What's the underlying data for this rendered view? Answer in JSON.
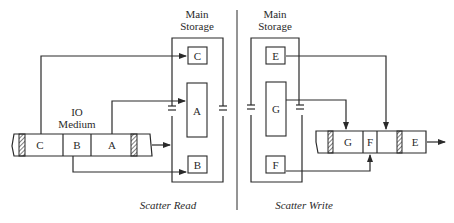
{
  "left_panel": {
    "storage_title_line1": "Main",
    "storage_title_line2": "Storage",
    "medium_title_line1": "IO",
    "medium_title_line2": "Medium",
    "medium_segments": [
      "C",
      "B",
      "A"
    ],
    "storage_blocks": [
      "C",
      "A",
      "B"
    ],
    "caption": "Scatter Read"
  },
  "right_panel": {
    "storage_title_line1": "Main",
    "storage_title_line2": "Storage",
    "medium_segments": [
      "G",
      "F",
      "E"
    ],
    "storage_blocks": [
      "E",
      "G",
      "F"
    ],
    "caption": "Scatter Write"
  },
  "colors": {
    "ink": "#2a2a2a",
    "background": "#ffffff"
  }
}
